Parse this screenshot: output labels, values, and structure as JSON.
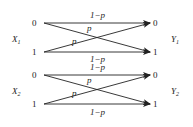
{
  "channels": [
    {
      "input_label": "X",
      "input_sub": "1",
      "output_label": "Y",
      "output_sub": "1",
      "inputs": [
        "0",
        "1"
      ],
      "outputs": [
        "0",
        "1"
      ],
      "top_label": "1−p",
      "bottom_label": "1−p",
      "cross_label_a": "p",
      "cross_label_b": "p"
    },
    {
      "input_label": "X",
      "input_sub": "2",
      "output_label": "Y",
      "output_sub": "2",
      "inputs": [
        "0",
        "1"
      ],
      "outputs": [
        "0",
        "1"
      ],
      "top_label": "1−p",
      "bottom_label": "1−p",
      "cross_label_a": "p",
      "cross_label_b": "p"
    }
  ],
  "colors": {
    "line": "#222222",
    "text": "#222222",
    "background": "#ffffff"
  }
}
